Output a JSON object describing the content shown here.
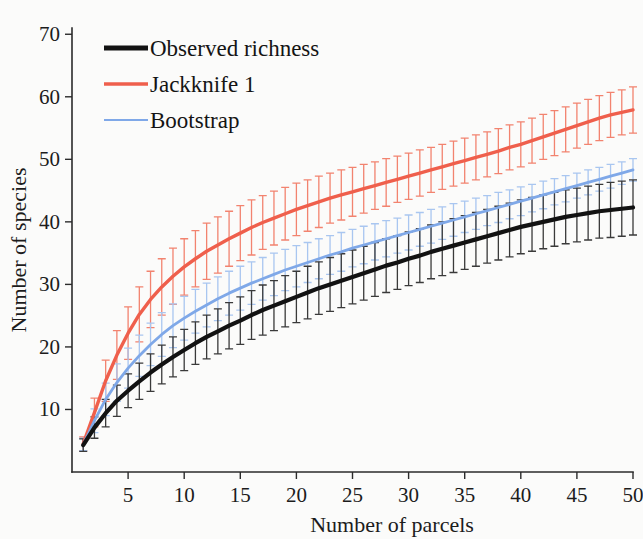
{
  "chart_data": {
    "type": "line",
    "title": "",
    "xlabel": "Number of parcels",
    "ylabel": "Number of species",
    "xlim": [
      0,
      50
    ],
    "ylim": [
      0,
      71
    ],
    "grid": false,
    "legend_position": "top-left",
    "xticks": [
      5,
      10,
      15,
      20,
      25,
      30,
      35,
      40,
      45,
      50
    ],
    "yticks": [
      10,
      20,
      30,
      40,
      50,
      60,
      70
    ],
    "xtick_labels": [
      "5",
      "10",
      "15",
      "20",
      "25",
      "30",
      "35",
      "40",
      "45",
      "50"
    ],
    "ytick_labels": [
      "10",
      "20",
      "30",
      "40",
      "50",
      "60",
      "70"
    ],
    "x": [
      1,
      2,
      3,
      4,
      5,
      6,
      7,
      8,
      9,
      10,
      11,
      12,
      13,
      14,
      15,
      16,
      17,
      18,
      19,
      20,
      21,
      22,
      23,
      24,
      25,
      26,
      27,
      28,
      29,
      30,
      31,
      32,
      33,
      34,
      35,
      36,
      37,
      38,
      39,
      40,
      41,
      42,
      43,
      44,
      45,
      46,
      47,
      48,
      49,
      50
    ],
    "series": [
      {
        "name": "Observed richness",
        "color": "#121212",
        "line_width": 4.2,
        "error_color": "#3a3a3a",
        "values": [
          4.3,
          7.1,
          9.4,
          11.4,
          13.0,
          14.5,
          15.9,
          17.2,
          18.4,
          19.5,
          20.6,
          21.6,
          22.5,
          23.4,
          24.2,
          25.1,
          25.9,
          26.6,
          27.3,
          28.0,
          28.7,
          29.4,
          30.0,
          30.6,
          31.2,
          31.8,
          32.4,
          33.0,
          33.5,
          34.1,
          34.6,
          35.2,
          35.7,
          36.2,
          36.7,
          37.2,
          37.7,
          38.2,
          38.7,
          39.2,
          39.6,
          40.0,
          40.4,
          40.8,
          41.1,
          41.4,
          41.7,
          41.9,
          42.1,
          42.3
        ],
        "error": [
          1.0,
          1.7,
          2.2,
          2.5,
          2.7,
          2.9,
          3.0,
          3.1,
          3.2,
          3.3,
          3.4,
          3.5,
          3.6,
          3.7,
          3.8,
          3.9,
          4.0,
          4.0,
          4.1,
          4.1,
          4.2,
          4.2,
          4.3,
          4.3,
          4.3,
          4.3,
          4.3,
          4.3,
          4.3,
          4.3,
          4.3,
          4.3,
          4.3,
          4.3,
          4.3,
          4.3,
          4.3,
          4.3,
          4.3,
          4.3,
          4.3,
          4.3,
          4.3,
          4.3,
          4.3,
          4.3,
          4.3,
          4.4,
          4.4,
          4.4
        ]
      },
      {
        "name": "Jackknife 1",
        "color": "#ef5f4c",
        "line_width": 3.4,
        "error_color": "#f2836f",
        "values": [
          4.5,
          9.5,
          14.6,
          18.7,
          22.2,
          25.2,
          27.6,
          29.6,
          31.3,
          32.8,
          34.1,
          35.3,
          36.3,
          37.3,
          38.2,
          39.1,
          39.9,
          40.6,
          41.3,
          42.0,
          42.6,
          43.2,
          43.8,
          44.3,
          44.8,
          45.3,
          45.8,
          46.3,
          46.8,
          47.3,
          47.8,
          48.3,
          48.8,
          49.3,
          49.8,
          50.3,
          50.8,
          51.3,
          51.9,
          52.4,
          53.0,
          53.6,
          54.2,
          54.8,
          55.4,
          56.0,
          56.6,
          57.1,
          57.5,
          57.9
        ],
        "error": [
          1.1,
          2.3,
          3.3,
          3.9,
          4.2,
          4.4,
          4.5,
          4.5,
          4.5,
          4.5,
          4.5,
          4.5,
          4.5,
          4.4,
          4.4,
          4.4,
          4.3,
          4.3,
          4.2,
          4.2,
          4.1,
          4.1,
          4.0,
          4.0,
          3.9,
          3.9,
          3.8,
          3.8,
          3.7,
          3.7,
          3.7,
          3.6,
          3.6,
          3.6,
          3.6,
          3.6,
          3.6,
          3.6,
          3.6,
          3.6,
          3.6,
          3.6,
          3.6,
          3.6,
          3.6,
          3.6,
          3.6,
          3.6,
          3.6,
          3.7
        ]
      },
      {
        "name": "Bootstrap",
        "color": "#7fa8e8",
        "line_width": 2.8,
        "error_color": "#a9c6f0",
        "values": [
          4.4,
          8.2,
          11.6,
          14.3,
          16.6,
          18.6,
          20.4,
          22.0,
          23.4,
          24.6,
          25.7,
          26.7,
          27.7,
          28.6,
          29.4,
          30.2,
          30.9,
          31.6,
          32.3,
          32.9,
          33.5,
          34.1,
          34.7,
          35.2,
          35.8,
          36.3,
          36.8,
          37.3,
          37.8,
          38.3,
          38.8,
          39.3,
          39.8,
          40.3,
          40.8,
          41.3,
          41.8,
          42.3,
          42.8,
          43.3,
          43.8,
          44.3,
          44.8,
          45.3,
          45.8,
          46.3,
          46.8,
          47.3,
          47.8,
          48.3
        ],
        "error": [
          1.0,
          1.9,
          2.6,
          3.0,
          3.2,
          3.3,
          3.4,
          3.5,
          3.5,
          3.5,
          3.5,
          3.5,
          3.5,
          3.5,
          3.5,
          3.4,
          3.4,
          3.4,
          3.3,
          3.3,
          3.2,
          3.2,
          3.1,
          3.1,
          3.0,
          3.0,
          2.9,
          2.9,
          2.8,
          2.8,
          2.7,
          2.7,
          2.6,
          2.6,
          2.5,
          2.5,
          2.4,
          2.4,
          2.3,
          2.3,
          2.2,
          2.2,
          2.1,
          2.1,
          2.0,
          2.0,
          1.9,
          1.9,
          1.8,
          1.8
        ]
      }
    ],
    "legend": [
      {
        "label": "Observed richness",
        "color": "#121212",
        "line_width": 5.0
      },
      {
        "label": "Jackknife 1",
        "color": "#ef5f4c",
        "line_width": 3.4
      },
      {
        "label": "Bootstrap",
        "color": "#7fa8e8",
        "line_width": 2.2
      }
    ]
  }
}
